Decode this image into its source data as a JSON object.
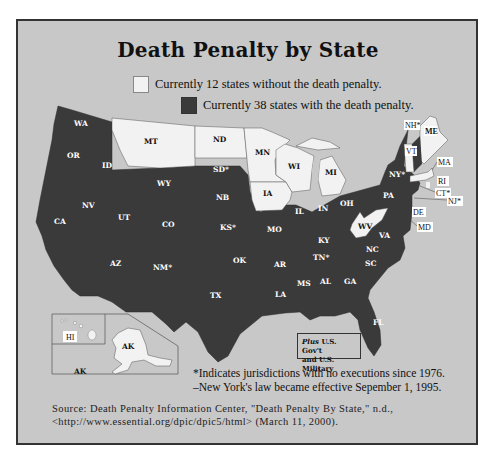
{
  "title": "Death Penalty by State",
  "legend": {
    "without": {
      "label": "Currently 12 states without the death penalty.",
      "color": "#f2f2f2"
    },
    "with": {
      "label": "Currently 38 states with the death penalty.",
      "color": "#3a3a3a"
    }
  },
  "colors": {
    "background": "#c8c8c8",
    "frame": "#333333",
    "with_penalty": "#3a3a3a",
    "without_penalty": "#f2f2f2"
  },
  "states_without": [
    "MT",
    "ND",
    "MN",
    "WI",
    "MI",
    "IA",
    "WV",
    "VT",
    "ME",
    "MA",
    "RI",
    "HI",
    "AK"
  ],
  "states_with": [
    "WA",
    "OR",
    "CA",
    "ID",
    "NV",
    "UT",
    "AZ",
    "WY",
    "CO",
    "NM*",
    "SD*",
    "NB",
    "KS*",
    "OK",
    "TX",
    "MO",
    "AR",
    "LA",
    "IL",
    "IN",
    "OH",
    "KY",
    "TN*",
    "MS",
    "AL",
    "GA",
    "FL",
    "SC",
    "NC",
    "VA",
    "PA",
    "NY*",
    "NH*",
    "CT*",
    "NJ*",
    "DE",
    "MD"
  ],
  "labels": {
    "WA": "WA",
    "OR": "OR",
    "CA": "CA",
    "ID": "ID",
    "NV": "NV",
    "UT": "UT",
    "AZ": "AZ",
    "MT": "MT",
    "WY": "WY",
    "CO": "CO",
    "NM": "NM*",
    "ND": "ND",
    "SD": "SD*",
    "NB": "NB",
    "KS": "KS*",
    "OK": "OK",
    "TX": "TX",
    "MN": "MN",
    "IA": "IA",
    "MO": "MO",
    "AR": "AR",
    "LA": "LA",
    "WI": "WI",
    "IL": "IL",
    "MI": "MI",
    "IN": "IN",
    "OH": "OH",
    "KY": "KY",
    "TN": "TN*",
    "MS": "MS",
    "AL": "AL",
    "GA": "GA",
    "FL": "FL",
    "SC": "SC",
    "NC": "NC",
    "VA": "VA",
    "WV": "WV",
    "PA": "PA",
    "NY": "NY*",
    "VT": "VT",
    "NH": "NH*",
    "ME": "ME",
    "MA": "MA",
    "RI": "RI",
    "CT": "CT*",
    "NJ": "NJ*",
    "DE": "DE",
    "MD": "MD",
    "HI": "HI",
    "AK": "AK"
  },
  "plus_box": {
    "italic": "Plus",
    "line1_rest": " U.S. Gov't",
    "line2": "and U.S. Military"
  },
  "notes": {
    "asterisk": "*Indicates jurisdictions with no executions since 1976.",
    "ny": "–New York's law became effective Sepember 1, 1995."
  },
  "source": {
    "line1": "Source: Death Penalty Information Center, \"Death Penalty By State,\" n.d.,",
    "line2": "<http://www.essential.org/dpic/dpic5/html> (March 11, 2000)."
  }
}
